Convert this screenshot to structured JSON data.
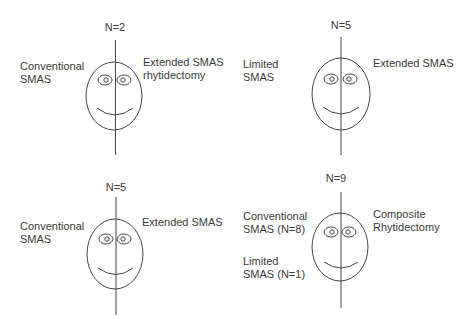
{
  "panels": [
    {
      "n_label": "N=2",
      "left_label": [
        "Conventional",
        "SMAS"
      ],
      "right_label": [
        "Extended SMAS",
        "rhytidectomy"
      ]
    },
    {
      "n_label": "N=5",
      "left_label": [
        "Limited",
        "SMAS"
      ],
      "right_label": [
        "Extended SMAS"
      ]
    },
    {
      "n_label": "N=5",
      "left_label": [
        "Conventional",
        "SMAS"
      ],
      "right_label": [
        "Extended SMAS"
      ]
    },
    {
      "n_label": "N=9",
      "left_label": [
        "Conventional",
        "SMAS (N=8)"
      ],
      "left_label_2": [
        "Limited",
        "SMAS (N=1)"
      ],
      "right_label": [
        "Composite",
        "Rhytidectomy"
      ]
    }
  ],
  "colors": {
    "line": "#444444",
    "text": "#3a3a3a",
    "background": "#ffffff"
  }
}
